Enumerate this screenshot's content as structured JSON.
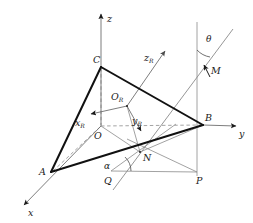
{
  "figure": {
    "type": "geometry-diagram",
    "background": "#ffffff",
    "width": 253,
    "height": 223,
    "line_color_main": "#1a1a1a",
    "line_color_thin": "#808080",
    "line_color_dashed": "#999999"
  },
  "axes": {
    "world": [
      {
        "id": "z",
        "label": "z",
        "label_x": 110,
        "label_y": 20,
        "from": [
          101,
          126
        ],
        "to": [
          101,
          13
        ]
      },
      {
        "id": "y",
        "label": "y",
        "label_x": 240,
        "label_y": 136,
        "from": [
          203,
          125
        ],
        "to": [
          237,
          126
        ]
      },
      {
        "id": "x",
        "label": "x",
        "label_x": 28,
        "label_y": 214,
        "from": [
          101,
          126
        ],
        "to": [
          23,
          206
        ]
      }
    ],
    "rotated": [
      {
        "id": "zR",
        "label": "z",
        "sub": "R",
        "label_x": 145,
        "label_y": 60,
        "from": [
          127,
          106
        ],
        "to": [
          166,
          50
        ]
      },
      {
        "id": "xR",
        "label": "x",
        "sub": "R",
        "label_x": 77,
        "label_y": 124,
        "from": [
          127,
          106
        ],
        "to": [
          90,
          114
        ]
      },
      {
        "id": "yR",
        "label": "y",
        "sub": "R",
        "label_x": 133,
        "label_y": 122,
        "from": [
          127,
          106
        ],
        "to": [
          142,
          133
        ]
      }
    ]
  },
  "points": [
    {
      "id": "C",
      "label": "C",
      "x": 101,
      "y": 67,
      "label_x": 93,
      "label_y": 62
    },
    {
      "id": "A",
      "label": "A",
      "x": 51,
      "y": 172,
      "label_x": 40,
      "label_y": 171
    },
    {
      "id": "B",
      "label": "B",
      "x": 203,
      "y": 125,
      "label_x": 205,
      "label_y": 120
    },
    {
      "id": "O",
      "label": "O",
      "x": 101,
      "y": 126,
      "label_x": 94,
      "label_y": 137
    },
    {
      "id": "OR",
      "label": "O",
      "sub": "R",
      "x": 127,
      "y": 106,
      "label_x": 112,
      "label_y": 99
    },
    {
      "id": "N",
      "label": "N",
      "x": 140,
      "y": 152,
      "label_x": 143,
      "label_y": 160
    },
    {
      "id": "M",
      "label": "M",
      "x": 207,
      "y": 68,
      "label_x": 211,
      "label_y": 73
    },
    {
      "id": "P",
      "label": "P",
      "x": 197,
      "y": 172,
      "label_x": 197,
      "label_y": 182
    },
    {
      "id": "Q",
      "label": "Q",
      "x": 111,
      "y": 171,
      "label_x": 105,
      "label_y": 181
    }
  ],
  "angles": [
    {
      "id": "theta",
      "label": "θ",
      "label_x": 207,
      "label_y": 41,
      "vertex": [
        197,
        73
      ],
      "arc": "M 197 53 A 20 20 0 0 0 211 60"
    },
    {
      "id": "alpha",
      "label": "α",
      "label_x": 106,
      "label_y": 167,
      "vertex": [
        111,
        171
      ],
      "arc": "M 130 171 A 19 19 0 0 0 124 158"
    }
  ],
  "edges": {
    "triangle": [
      {
        "id": "CA",
        "from": [
          101,
          67
        ],
        "to": [
          51,
          172
        ],
        "style": "thick"
      },
      {
        "id": "CB",
        "from": [
          101,
          67
        ],
        "to": [
          203,
          125
        ],
        "style": "thick"
      },
      {
        "id": "AB",
        "from": [
          51,
          172
        ],
        "to": [
          203,
          125
        ],
        "style": "thick"
      }
    ],
    "dashed": [
      {
        "id": "CO",
        "from": [
          101,
          67
        ],
        "to": [
          101,
          126
        ]
      },
      {
        "id": "OB",
        "from": [
          101,
          126
        ],
        "to": [
          203,
          125
        ]
      },
      {
        "id": "OA",
        "from": [
          101,
          126
        ],
        "to": [
          51,
          172
        ]
      }
    ],
    "thin": [
      {
        "id": "ON",
        "from": [
          101,
          126
        ],
        "to": [
          140,
          152
        ]
      },
      {
        "id": "NB",
        "from": [
          140,
          152
        ],
        "to": [
          203,
          125
        ]
      },
      {
        "id": "QN",
        "from": [
          111,
          171
        ],
        "to": [
          171,
          128
        ]
      },
      {
        "id": "QP",
        "from": [
          111,
          171
        ],
        "to": [
          197,
          172
        ]
      },
      {
        "id": "PB",
        "from": [
          197,
          172
        ],
        "to": [
          197,
          122
        ]
      },
      {
        "id": "PN",
        "from": [
          197,
          172
        ],
        "to": [
          129,
          140
        ]
      },
      {
        "id": "vertB",
        "from": [
          197,
          22
        ],
        "to": [
          197,
          176
        ]
      },
      {
        "id": "ray-M",
        "from": [
          113,
          190
        ],
        "to": [
          232,
          30
        ]
      }
    ]
  },
  "caption": {
    "labels": [
      "C",
      "A",
      "B",
      "O",
      "N",
      "M",
      "P",
      "Q",
      "x",
      "y",
      "z",
      "θ",
      "α"
    ],
    "subscripted": [
      "x_R",
      "y_R",
      "z_R",
      "O_R"
    ]
  }
}
